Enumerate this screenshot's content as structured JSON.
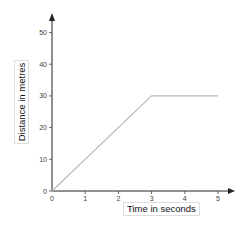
{
  "chart_data": {
    "type": "line",
    "title": "",
    "xlabel": "Time in seconds",
    "ylabel": "Distance in metres",
    "x": [
      0,
      3,
      5
    ],
    "series": [
      {
        "name": "Distance",
        "values": [
          0,
          30,
          30
        ],
        "color": "#b8b8b8"
      }
    ],
    "xticks": [
      0,
      1,
      2,
      3,
      4,
      5
    ],
    "yticks": [
      0,
      10,
      20,
      30,
      40,
      50
    ],
    "xlim": [
      0,
      5.5
    ],
    "ylim": [
      0,
      55
    ],
    "grid": false,
    "legend": null
  },
  "labels": {
    "x_axis": "Time in seconds",
    "y_axis": "Distance in metres"
  }
}
